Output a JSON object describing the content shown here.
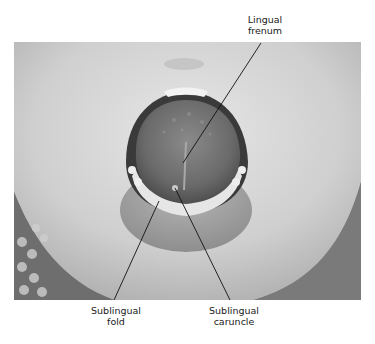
{
  "figure": {
    "labels": [
      {
        "line1": "Lingual",
        "line2": "frenum"
      },
      {
        "line1": "Sublingual",
        "line2": "fold"
      },
      {
        "line1": "Sublingual",
        "line2": "caruncle"
      }
    ]
  }
}
